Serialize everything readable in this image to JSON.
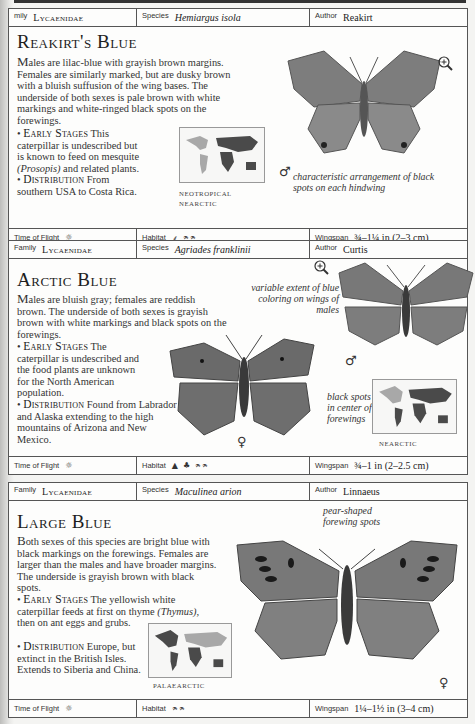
{
  "entries": [
    {
      "family_label": "mily",
      "family": "Lycaenidae",
      "species_label": "Species",
      "species": "Hemiargus isola",
      "author_label": "Author",
      "author": "Reakirt",
      "title": "Reakirt's Blue",
      "description_drop": "M",
      "description": "ales are lilac-blue with grayish brown margins. Females are similarly marked, but are dusky brown with a bluish suffusion of the wing bases. The underside of both sexes is pale brown with white markings and white-ringed black spots on the forewings.",
      "early_stages_label": "Early Stages",
      "early_stages_pre": "This caterpillar is undescribed but is known to feed on mesquite",
      "early_stages_italic": "(Prosopis)",
      "early_stages_post": "and related plants.",
      "distribution_label": "Distribution",
      "distribution": "From southern USA to Costa Rica.",
      "map_regions": [
        "NEOTROPICAL",
        "NEARCTIC"
      ],
      "annotations": [
        "characteristic arrangement of black spots on each hindwing"
      ],
      "sex_symbols": [
        "♂"
      ],
      "time_of_flight_label": "Time of Flight",
      "time_of_flight_icon": "sun-icon",
      "habitat_label": "Habitat",
      "habitat_icons": [
        "grass-icon",
        "meadow-icon"
      ],
      "wingspan_label": "Wingspan",
      "wingspan": "¾–1¼ in (2–3 cm)"
    },
    {
      "family_label": "Family",
      "family": "Lycaenidae",
      "species_label": "Species",
      "species": "Agriades franklinii",
      "author_label": "Author",
      "author": "Curtis",
      "title": "Arctic Blue",
      "description_drop": "M",
      "description": "ales are bluish gray; females are reddish brown. The underside of both sexes is grayish brown with white markings and black spots on the forewings.",
      "early_stages_label": "Early Stages",
      "early_stages_pre": "The caterpillar is undescribed and the food plants are unknown for the North American population.",
      "early_stages_italic": "",
      "early_stages_post": "",
      "distribution_label": "Distribution",
      "distribution": "Found from Labrador and Alaska extending to the high mountains of Arizona and New Mexico.",
      "map_regions": [
        "NEARCTIC"
      ],
      "annotations": [
        "variable extent of blue coloring on wings of males",
        "black spots in center of forewings"
      ],
      "sex_symbols": [
        "♂",
        "♀"
      ],
      "time_of_flight_label": "Time of Flight",
      "time_of_flight_icon": "sun-icon",
      "habitat_label": "Habitat",
      "habitat_icons": [
        "mountain-icon",
        "tree-icon",
        "meadow-icon"
      ],
      "wingspan_label": "Wingspan",
      "wingspan": "¾–1 in (2–2.5 cm)"
    },
    {
      "family_label": "Family",
      "family": "Lycaenidae",
      "species_label": "Species",
      "species": "Maculinea arion",
      "author_label": "Author",
      "author": "Linnaeus",
      "title": "Large Blue",
      "description_drop": "B",
      "description": "oth sexes of this species are bright blue with black markings on the forewings. Females are larger than the males and have broader margins. The underside is grayish brown with black spots.",
      "early_stages_label": "Early Stages",
      "early_stages_pre": "The yellowish white caterpillar feeds at first on thyme",
      "early_stages_italic": "(Thymus),",
      "early_stages_post": "then on ant eggs and grubs.",
      "distribution_label": "Distribution",
      "distribution": "Europe, but extinct in the British Isles. Extends to Siberia and China.",
      "map_regions": [
        "PALAEARCTIC"
      ],
      "annotations": [
        "pear-shaped forewing spots"
      ],
      "sex_symbols": [
        "♀"
      ],
      "time_of_flight_label": "Time of Flight",
      "time_of_flight_icon": "sun-icon",
      "habitat_label": "Habitat",
      "habitat_icons": [
        "meadow-icon"
      ],
      "wingspan_label": "Wingspan",
      "wingspan": "1¼–1½ in (3–4 cm)"
    }
  ],
  "glyphs": {
    "sun": "☼",
    "grass": "⸙",
    "meadow": "ᨑᨑ",
    "mountain": "▲",
    "tree": "♣",
    "bullet": "•"
  },
  "colors": {
    "wing_gray": "#7d7d7d",
    "wing_dark": "#555555",
    "map_land_dark": "#4a4a4a",
    "map_land_light": "#a8a8a8",
    "border": "#555555"
  }
}
